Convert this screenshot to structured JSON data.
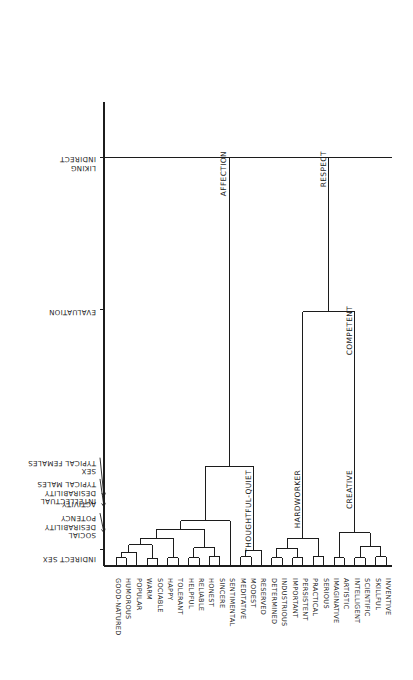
{
  "figure": {
    "orientation": "rotated-90",
    "background_color": "#ffffff",
    "line_color": "#1c1c1c"
  },
  "chart_data": {
    "type": "dendrogram",
    "title": "",
    "xlabel": "",
    "ylabel": "",
    "grid": false,
    "legend": "none",
    "leaves": [
      "GOOD-NATURED",
      "HUMOROUS",
      "POPULAR",
      "WARM",
      "SOCIABLE",
      "HAPPY",
      "TOLERANT",
      "HELPFUL",
      "RELIABLE",
      "HONEST",
      "SINCERE",
      "SENTIMENTAL",
      "MEDITATIVE",
      "MODEST",
      "RESERVED",
      "DETERMINED",
      "INDUSTRIOUS",
      "IMPORTANT",
      "PERSISTENT",
      "PRACTICAL",
      "SERIOUS",
      "IMAGINATIVE",
      "ARTISTIC",
      "INTELLIGENT",
      "SCIENTIFIC",
      "SKILLFUL",
      "INVENTIVE"
    ],
    "cluster_labels": [
      {
        "name": "AFFECTION",
        "height": 0.88,
        "leaf_from": 0,
        "leaf_to": 14
      },
      {
        "name": "RESPECT",
        "height": 0.88,
        "leaf_from": 15,
        "leaf_to": 26
      },
      {
        "name": "COMPETENT",
        "height": 0.55,
        "leaf_from": 21,
        "leaf_to": 26
      },
      {
        "name": "THOUGHTFUL-QUIET",
        "height": 0.19,
        "leaf_from": 12,
        "leaf_to": 14
      },
      {
        "name": "HARDWORKER",
        "height": 0.19,
        "leaf_from": 15,
        "leaf_to": 20
      },
      {
        "name": "CREATIVE",
        "height": 0.19,
        "leaf_from": 21,
        "leaf_to": 26
      }
    ],
    "axis_labels": [
      {
        "text": "INDIRECT LIKING",
        "position": 0.885
      },
      {
        "text": "EVALUATION",
        "position": 0.555
      },
      {
        "text": "SEX TYPICAL FEMALES",
        "position": 0.205
      },
      {
        "text": "INTELLECTUAL DESIRABILITY TYPICAL MALES",
        "position": 0.175
      },
      {
        "text": "ACTIVITY",
        "position": 0.15
      },
      {
        "text": "SOCIAL DESIRABILITY POTENCY",
        "position": 0.125
      },
      {
        "text": "INDIRECT SEX",
        "position": 0.035
      }
    ],
    "axis_label_lines": [
      [
        "TYPICAL FEMALES",
        "SEX"
      ],
      [
        "TYPICAL MALES",
        "DESIRABILITY",
        "INTELLECTUAL"
      ],
      [
        "ACTIVITY"
      ],
      [
        "POTENCY",
        "DESIRABILITY",
        "SOCIAL"
      ],
      [
        "INDIRECT SEX"
      ],
      [
        "INDIRECT",
        "LIKING"
      ],
      [
        "EVALUATION"
      ]
    ]
  }
}
